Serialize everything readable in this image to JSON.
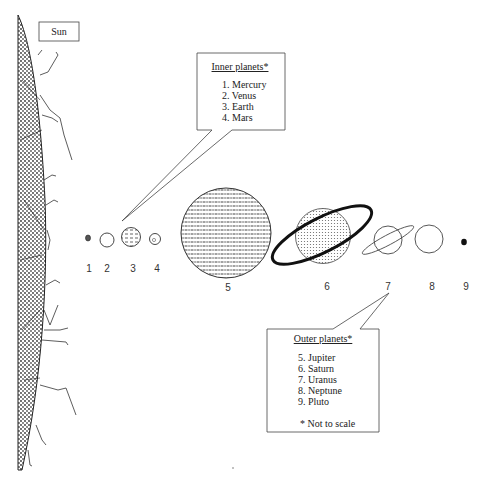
{
  "diagram": {
    "sun_label": "Sun",
    "inner_box": {
      "heading": "Inner planets*",
      "items": [
        "1. Mercury",
        "2. Venus",
        "3. Earth",
        "4. Mars"
      ]
    },
    "outer_box": {
      "heading": "Outer planets*",
      "items": [
        "5. Jupiter",
        "6. Saturn",
        "7. Uranus",
        "8. Neptune",
        "9. Pluto"
      ],
      "footnote": "* Not to scale"
    },
    "planet_numbers": [
      "1",
      "2",
      "3",
      "4",
      "5",
      "6",
      "7",
      "8",
      "9"
    ]
  }
}
